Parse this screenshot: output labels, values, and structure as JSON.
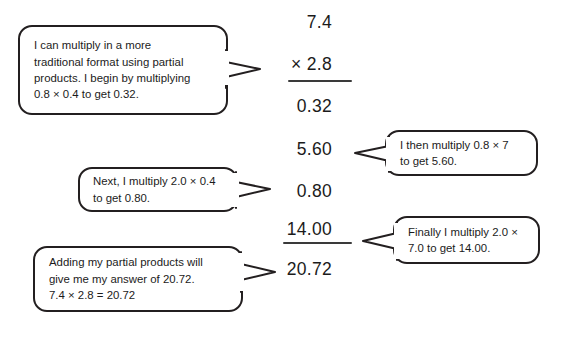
{
  "page": {
    "background_color": "#ffffff",
    "ink_color": "#1b1b1b",
    "bubble_border_color": "#231f20",
    "rule_color": "#3a3a3a"
  },
  "math": {
    "rows": [
      {
        "id": "factor-1",
        "text": "7.4"
      },
      {
        "id": "factor-2",
        "text": "× 2.8"
      },
      {
        "id": "partial-product-1",
        "text": "0.32"
      },
      {
        "id": "partial-product-2",
        "text": "5.60"
      },
      {
        "id": "partial-product-3",
        "text": "0.80"
      },
      {
        "id": "partial-product-4",
        "text": "14.00"
      },
      {
        "id": "final-answer",
        "text": "20.72"
      }
    ],
    "rules": [
      {
        "id": "multiplication-rule"
      },
      {
        "id": "sum-rule"
      }
    ]
  },
  "bubbles": [
    {
      "id": "bubble-intro",
      "lines": [
        "I can multiply in a more",
        "traditional format using partial",
        "products. I begin by multiplying",
        "0.8 × 0.4 to get 0.32."
      ]
    },
    {
      "id": "bubble-second-partial",
      "lines": [
        "I then multiply 0.8 × 7",
        "to get 5.60."
      ]
    },
    {
      "id": "bubble-third-partial",
      "lines": [
        "Next, I multiply 2.0 × 0.4",
        "to get 0.80."
      ]
    },
    {
      "id": "bubble-fourth-partial",
      "lines": [
        "Finally I multiply 2.0 ×",
        "7.0 to get 14.00."
      ]
    },
    {
      "id": "bubble-sum",
      "lines": [
        "Adding my partial products will",
        "give me my answer of 20.72.",
        "7.4 × 2.8 = 20.72"
      ]
    }
  ]
}
